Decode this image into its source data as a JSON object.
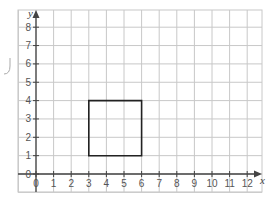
{
  "chart_data": {
    "type": "diagram",
    "title": "",
    "xlabel": "x",
    "ylabel": "y",
    "xlim": [
      0,
      12
    ],
    "ylim": [
      0,
      8
    ],
    "x_ticks": [
      "0",
      "1",
      "2",
      "3",
      "4",
      "5",
      "6",
      "7",
      "8",
      "9",
      "10",
      "11",
      "12"
    ],
    "y_ticks": [
      "0",
      "1",
      "2",
      "3",
      "4",
      "5",
      "6",
      "7",
      "8"
    ],
    "grid": true,
    "shapes": [
      {
        "name": "square",
        "vertices": [
          [
            3,
            1
          ],
          [
            6,
            1
          ],
          [
            6,
            4
          ],
          [
            3,
            4
          ]
        ]
      }
    ]
  },
  "colors": {
    "grid": "#c8c8c8",
    "axis": "#444444",
    "shape": "#222222",
    "bracket": "#aaaaaa"
  }
}
